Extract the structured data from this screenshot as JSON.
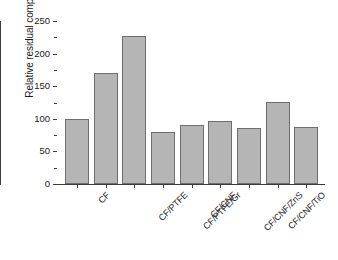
{
  "chart_data": {
    "type": "bar",
    "title": "",
    "xlabel": "",
    "ylabel": "Relative residual compression [%]",
    "ylim": [
      0,
      250
    ],
    "yticks": [
      0,
      50,
      100,
      150,
      200,
      250
    ],
    "ytick_labels": [
      "0",
      "50",
      "100",
      "150",
      "200",
      "250"
    ],
    "grid": false,
    "legend": null,
    "categories": [
      "CF",
      "CF/PTFE",
      "CF/PTFE/Gr",
      "CF/CNF",
      "CF/CNF/ZnS",
      "CF/CNF/TiO",
      "CF/CNF/ZnS/TiO",
      "CF/hGr/MoS",
      "CF/FeO"
    ],
    "values": [
      100,
      171,
      227,
      80,
      90,
      97,
      86,
      126,
      87
    ],
    "bar_fill_color": "#b5b5b5",
    "bar_edge_color": "#6e6e6e",
    "axis_color": "#3a3a3a",
    "background_color": "#ffffff"
  }
}
